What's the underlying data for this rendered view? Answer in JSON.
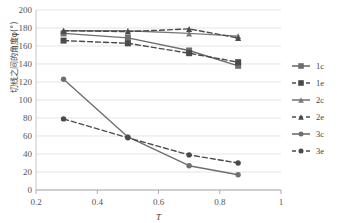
{
  "chart_data": {
    "type": "line",
    "title": "",
    "xlabel": "T̄",
    "ylabel": "切线之间的角度φ(°)",
    "xlim": [
      0.2,
      1.0
    ],
    "ylim": [
      0,
      200
    ],
    "xticks": [
      "0.2",
      "0.4",
      "0.6",
      "0.8",
      "1"
    ],
    "xtick_values": [
      0.2,
      0.4,
      0.6,
      0.8,
      1.0
    ],
    "yticks": [
      "0",
      "20",
      "40",
      "60",
      "80",
      "100",
      "120",
      "140",
      "160",
      "180",
      "200"
    ],
    "ytick_values": [
      0,
      20,
      40,
      60,
      80,
      100,
      120,
      140,
      160,
      180,
      200
    ],
    "grid": "horizontal",
    "legend_position": "right",
    "x": [
      0.29,
      0.5,
      0.7,
      0.86
    ],
    "series": [
      {
        "name": "1c",
        "style": "solid",
        "marker": "square",
        "color": "#6e6e6e",
        "values": [
          174,
          169,
          155,
          138
        ]
      },
      {
        "name": "1e",
        "style": "dashed",
        "marker": "square",
        "color": "#4a4a4a",
        "values": [
          166,
          163,
          152,
          142
        ]
      },
      {
        "name": "2c",
        "style": "solid",
        "marker": "triangle",
        "color": "#7a7a7a",
        "values": [
          177,
          177,
          174,
          171
        ]
      },
      {
        "name": "2e",
        "style": "dashed",
        "marker": "triangle",
        "color": "#4a4a4a",
        "values": [
          177,
          176,
          179,
          169
        ]
      },
      {
        "name": "3c",
        "style": "solid",
        "marker": "circle",
        "color": "#6e6e6e",
        "values": [
          123,
          59,
          27,
          17
        ]
      },
      {
        "name": "3e",
        "style": "dashed",
        "marker": "circle",
        "color": "#4a4a4a",
        "values": [
          79,
          58,
          39,
          30
        ]
      }
    ]
  },
  "legend": {
    "items": [
      {
        "label": "1c"
      },
      {
        "label": "1e"
      },
      {
        "label": "2c"
      },
      {
        "label": "2e"
      },
      {
        "label": "3c"
      },
      {
        "label": "3e"
      }
    ]
  }
}
